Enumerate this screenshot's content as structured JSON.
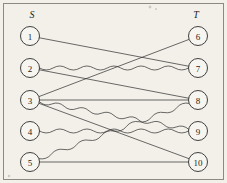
{
  "figure": {
    "type": "bipartite-graph",
    "width": 227,
    "height": 183,
    "background_color": "#f3f0e9",
    "border_color": "#8d8880",
    "edge_color": "#2b2b2b",
    "node_fill": "#f7f5ef",
    "node_stroke": "#2b2b2b",
    "node_radius": 9.5
  },
  "set_labels": {
    "left": "S",
    "right": "T",
    "left_x": 32,
    "left_y": 14,
    "right_x": 196,
    "right_y": 14
  },
  "nodes": {
    "left": [
      {
        "id": "1",
        "label": "1",
        "x": 30,
        "y": 36
      },
      {
        "id": "2",
        "label": "2",
        "x": 30,
        "y": 68
      },
      {
        "id": "3",
        "label": "3",
        "x": 30,
        "y": 100
      },
      {
        "id": "4",
        "label": "4",
        "x": 30,
        "y": 131
      },
      {
        "id": "5",
        "label": "5",
        "x": 30,
        "y": 162
      }
    ],
    "right": [
      {
        "id": "6",
        "label": "6",
        "x": 198,
        "y": 36
      },
      {
        "id": "7",
        "label": "7",
        "x": 198,
        "y": 68
      },
      {
        "id": "8",
        "label": "8",
        "x": 198,
        "y": 100
      },
      {
        "id": "9",
        "label": "9",
        "x": 198,
        "y": 131
      },
      {
        "id": "10",
        "label": "10",
        "x": 198,
        "y": 162
      }
    ]
  },
  "edges": [
    {
      "from": "1",
      "to": "7",
      "style": "straight"
    },
    {
      "from": "2",
      "to": "7",
      "style": "wavy"
    },
    {
      "from": "2",
      "to": "8",
      "style": "straight"
    },
    {
      "from": "3",
      "to": "6",
      "style": "straight"
    },
    {
      "from": "3",
      "to": "8",
      "style": "straight"
    },
    {
      "from": "3",
      "to": "9",
      "style": "wavy"
    },
    {
      "from": "3",
      "to": "10",
      "style": "straight"
    },
    {
      "from": "4",
      "to": "9",
      "style": "wavy"
    },
    {
      "from": "5",
      "to": "8",
      "style": "wavy"
    },
    {
      "from": "5",
      "to": "10",
      "style": "straight"
    }
  ],
  "specks": [
    {
      "x": 150,
      "y": 7,
      "r": 1.4
    },
    {
      "x": 156,
      "y": 9,
      "r": 1.0
    },
    {
      "x": 9,
      "y": 176,
      "r": 1.2
    }
  ]
}
